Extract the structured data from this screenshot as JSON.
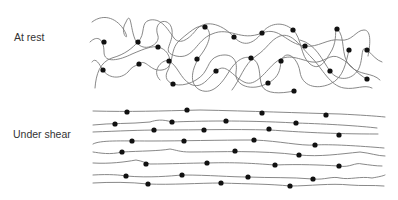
{
  "panels": [
    {
      "id": "rest",
      "label": "At rest",
      "description": "Entangled random-coil polymer chains with attached particles (dots)"
    },
    {
      "id": "shear",
      "label": "Under shear",
      "description": "Polymer chains aligned horizontally in flow direction with attached particles (dots)"
    }
  ],
  "colors": {
    "chain": "#7a7a7a",
    "dot": "#111111",
    "text": "#333333",
    "background": "#ffffff"
  },
  "rest_dots": [
    [
      104,
      42
    ],
    [
      138,
      42
    ],
    [
      158,
      47
    ],
    [
      103,
      70
    ],
    [
      139,
      64
    ],
    [
      173,
      84
    ],
    [
      205,
      27
    ],
    [
      234,
      37
    ],
    [
      169,
      61
    ],
    [
      197,
      59
    ],
    [
      216,
      71
    ],
    [
      262,
      33
    ],
    [
      293,
      30
    ],
    [
      305,
      46
    ],
    [
      251,
      58
    ],
    [
      281,
      61
    ],
    [
      268,
      83
    ],
    [
      337,
      29
    ],
    [
      349,
      50
    ],
    [
      367,
      50
    ],
    [
      330,
      71
    ],
    [
      367,
      79
    ],
    [
      294,
      91
    ]
  ],
  "shear_dots": [
    [
      127,
      112
    ],
    [
      187,
      110
    ],
    [
      262,
      113
    ],
    [
      326,
      115
    ],
    [
      115,
      124
    ],
    [
      172,
      122
    ],
    [
      226,
      121
    ],
    [
      296,
      123
    ],
    [
      154,
      130
    ],
    [
      204,
      130
    ],
    [
      269,
      129
    ],
    [
      339,
      135
    ],
    [
      132,
      141
    ],
    [
      184,
      141
    ],
    [
      254,
      140
    ],
    [
      315,
      145
    ],
    [
      122,
      152
    ],
    [
      235,
      151
    ],
    [
      299,
      155
    ],
    [
      146,
      164
    ],
    [
      207,
      163
    ],
    [
      275,
      165
    ],
    [
      339,
      166
    ],
    [
      126,
      176
    ],
    [
      182,
      175
    ],
    [
      248,
      177
    ],
    [
      313,
      179
    ],
    [
      148,
      184
    ],
    [
      221,
      183
    ],
    [
      290,
      186
    ]
  ]
}
